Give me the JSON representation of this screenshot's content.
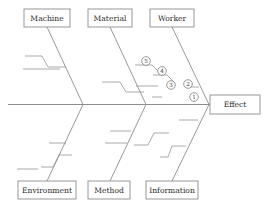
{
  "diagram": {
    "type": "fishbone-ishikawa",
    "title": "",
    "effect": {
      "label": "Effect",
      "x": 210,
      "y": 95,
      "width": 50,
      "height": 19
    },
    "spine": {
      "x1": 8,
      "y1": 104.5,
      "x2": 210,
      "y2": 104.5
    },
    "colors": {
      "line": "#8d8d8d",
      "text": "#2b2b2b",
      "background": "#ffffff",
      "marker_stroke": "#7e7e7e"
    },
    "categories": [
      {
        "id": "machine",
        "label": "Machine",
        "side": "top",
        "box": {
          "x": 24,
          "y": 9,
          "width": 46,
          "height": 18
        },
        "bone": {
          "x1": 47,
          "y1": 27,
          "x2": 83,
          "y2": 104.5
        },
        "subbones": [
          {
            "type": "step",
            "points": "25,56 42,56 48,67 66,67"
          },
          {
            "type": "line",
            "points": "23,69 60,69"
          }
        ]
      },
      {
        "id": "material",
        "label": "Material",
        "side": "top",
        "box": {
          "x": 88,
          "y": 9,
          "width": 44,
          "height": 18
        },
        "bone": {
          "x1": 110,
          "y1": 27,
          "x2": 146,
          "y2": 104.5
        },
        "subbones": [
          {
            "type": "step",
            "points": "102,82 120,82 126,92 144,92"
          },
          {
            "type": "line",
            "points": "136,86 158,86"
          },
          {
            "type": "line",
            "points": "152,97 162,97"
          }
        ]
      },
      {
        "id": "worker",
        "label": "Worker",
        "side": "top",
        "box": {
          "x": 150,
          "y": 9,
          "width": 44,
          "height": 18
        },
        "bone": {
          "x1": 172,
          "y1": 27,
          "x2": 209,
          "y2": 104.5
        },
        "subbones": [
          {
            "type": "line",
            "points": "186,87 199,87"
          }
        ]
      },
      {
        "id": "environment",
        "label": "Environment",
        "side": "bottom",
        "box": {
          "x": 18,
          "y": 181,
          "width": 58,
          "height": 18
        },
        "bone": {
          "x1": 47,
          "y1": 181,
          "x2": 83,
          "y2": 104.5
        },
        "subbones": [
          {
            "type": "step",
            "points": "41,167 53,167 59,155 72,155"
          },
          {
            "type": "line",
            "points": "17,169 38,169"
          },
          {
            "type": "line",
            "points": "49,143 66,143"
          }
        ]
      },
      {
        "id": "method",
        "label": "Method",
        "side": "bottom",
        "box": {
          "x": 88,
          "y": 181,
          "width": 42,
          "height": 18
        },
        "bone": {
          "x1": 110,
          "y1": 181,
          "x2": 146,
          "y2": 104.5
        },
        "subbones": [
          {
            "type": "line",
            "points": "105,143 127,143"
          },
          {
            "type": "line",
            "points": "110,131 131,131"
          }
        ]
      },
      {
        "id": "information",
        "label": "Information",
        "side": "bottom",
        "box": {
          "x": 146,
          "y": 181,
          "width": 52,
          "height": 18
        },
        "bone": {
          "x1": 172,
          "y1": 181,
          "x2": 209,
          "y2": 104.5
        },
        "subbones": [
          {
            "type": "step",
            "points": "134,145 148,145 154,133 169,133"
          },
          {
            "type": "step",
            "points": "160,157 168,157 172,146 186,146"
          },
          {
            "type": "line",
            "points": "179,120 198,120"
          }
        ]
      }
    ],
    "markers": [
      {
        "id": "marker-5",
        "label": "5",
        "cx": 146,
        "cy": 61,
        "r": 4.3,
        "leader": "135,65 152,65 160,73"
      },
      {
        "id": "marker-4",
        "label": "4",
        "cx": 162,
        "cy": 71,
        "r": 4.3,
        "leader": "153,75 167,75 175,83"
      },
      {
        "id": "marker-3",
        "label": "3",
        "cx": 171,
        "cy": 85,
        "r": 4.3,
        "leader": ""
      },
      {
        "id": "marker-2",
        "label": "2",
        "cx": 188,
        "cy": 84,
        "r": 4.3,
        "leader": ""
      },
      {
        "id": "marker-1",
        "label": "1",
        "cx": 194,
        "cy": 97,
        "r": 4.3,
        "leader": ""
      }
    ]
  }
}
